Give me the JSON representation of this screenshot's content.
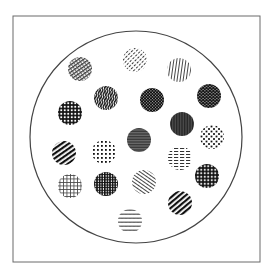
{
  "figure": {
    "frame": {
      "x": 13,
      "y": 16,
      "width": 247,
      "height": 246,
      "stroke": "#6a6a6a"
    },
    "outer_circle": {
      "cx": 136,
      "cy": 137,
      "r": 106,
      "stroke": "#444444"
    },
    "ink": "#1a1a1a",
    "circle_radius": 12,
    "circles": [
      {
        "id": 1,
        "cx": 80,
        "cy": 69,
        "pattern": "diag-hatch-medium"
      },
      {
        "id": 2,
        "cx": 135,
        "cy": 60,
        "pattern": "diag-dashed-light"
      },
      {
        "id": 3,
        "cx": 179,
        "cy": 70,
        "pattern": "vertical-lines-light"
      },
      {
        "id": 4,
        "cx": 106,
        "cy": 98,
        "pattern": "wavy-vertical-dark"
      },
      {
        "id": 5,
        "cx": 152,
        "cy": 100,
        "pattern": "brick-grid-dark"
      },
      {
        "id": 6,
        "cx": 209,
        "cy": 96,
        "pattern": "hex-lattice-dark"
      },
      {
        "id": 7,
        "cx": 70,
        "cy": 113,
        "pattern": "square-lattice-dark"
      },
      {
        "id": 8,
        "cx": 182,
        "cy": 124,
        "pattern": "vertical-fine-dark"
      },
      {
        "id": 9,
        "cx": 212,
        "cy": 137,
        "pattern": "checker-dots"
      },
      {
        "id": 10,
        "cx": 139,
        "cy": 140,
        "pattern": "horizontal-fine-dark"
      },
      {
        "id": 11,
        "cx": 64,
        "cy": 153,
        "pattern": "diag-thick-dark"
      },
      {
        "id": 12,
        "cx": 104,
        "cy": 152,
        "pattern": "dot-grid"
      },
      {
        "id": 13,
        "cx": 180,
        "cy": 158,
        "pattern": "horizontal-dashed"
      },
      {
        "id": 14,
        "cx": 207,
        "cy": 176,
        "pattern": "diamond-lattice-dark"
      },
      {
        "id": 15,
        "cx": 70,
        "cy": 186,
        "pattern": "open-grid-light"
      },
      {
        "id": 16,
        "cx": 106,
        "cy": 184,
        "pattern": "plaid-dark"
      },
      {
        "id": 17,
        "cx": 144,
        "cy": 182,
        "pattern": "diag-light-nwse"
      },
      {
        "id": 18,
        "cx": 180,
        "cy": 203,
        "pattern": "diag-thick-dark-2"
      },
      {
        "id": 19,
        "cx": 130,
        "cy": 221,
        "pattern": "zigzag-light"
      }
    ]
  }
}
